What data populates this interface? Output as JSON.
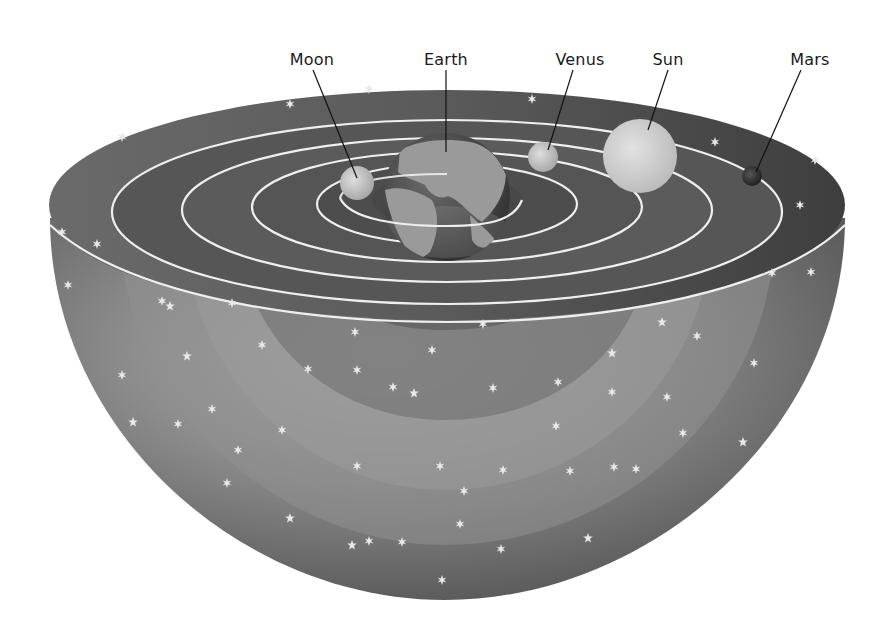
{
  "diagram": {
    "labels": {
      "moon": "Moon",
      "earth": "Earth",
      "venus": "Venus",
      "sun": "Sun",
      "mars": "Mars"
    },
    "bodies": [
      {
        "name": "Moon",
        "label_x": 312,
        "label_y": 58,
        "body_x": 357,
        "body_y": 183,
        "radius": 17,
        "color": "#cfcfcf"
      },
      {
        "name": "Earth",
        "label_x": 446,
        "label_y": 58,
        "body_x": 446,
        "body_y": 197,
        "radius": 64,
        "color": "#5a5a5a"
      },
      {
        "name": "Venus",
        "label_x": 580,
        "label_y": 58,
        "body_x": 543,
        "body_y": 157,
        "radius": 15,
        "color": "#c8c8c8"
      },
      {
        "name": "Sun",
        "label_x": 668,
        "label_y": 58,
        "body_x": 640,
        "body_y": 156,
        "radius": 37,
        "color": "#d4d4d4"
      },
      {
        "name": "Mars",
        "label_x": 810,
        "label_y": 58,
        "body_x": 752,
        "body_y": 176,
        "radius": 10,
        "color": "#3a3a3a"
      }
    ],
    "colors": {
      "background": "#ffffff",
      "shell_dark": "#4a4a4a",
      "shell_mid": "#7a7a7a",
      "shell_light": "#a8a8a8",
      "orbit_line": "#eeeeee",
      "leader_line": "#111111",
      "label_text": "#1a1a1a",
      "star": "#e6e6e6"
    }
  }
}
